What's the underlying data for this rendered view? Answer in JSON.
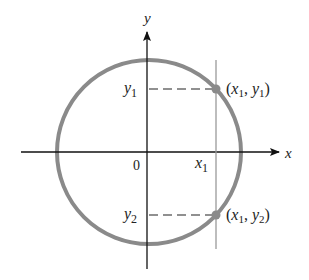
{
  "diagram": {
    "axes": {
      "x_label": "x",
      "y_label": "y",
      "origin_label": "0"
    },
    "ticks": {
      "x1": {
        "var": "x",
        "sub": "1"
      },
      "y1": {
        "var": "y",
        "sub": "1"
      },
      "y2": {
        "var": "y",
        "sub": "2"
      }
    },
    "points": [
      {
        "open": "(",
        "xv": "x",
        "xs": "1",
        "comma": ", ",
        "yv": "y",
        "ys": "1",
        "close": ")"
      },
      {
        "open": "(",
        "xv": "x",
        "xs": "1",
        "comma": ", ",
        "yv": "y",
        "ys": "2",
        "close": ")"
      }
    ],
    "colors": {
      "circle": "#8a8a8a",
      "axis": "#111111",
      "vertical_line": "#9a9a9a",
      "point": "#8a8a8a"
    }
  }
}
